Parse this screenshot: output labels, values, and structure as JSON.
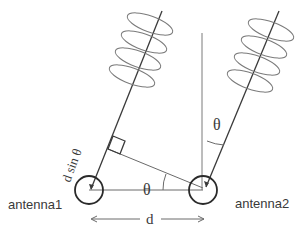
{
  "diagram": {
    "labels": {
      "antenna1": "antenna1",
      "antenna2": "antenna2",
      "spacing": "d",
      "path_difference": "d sin θ",
      "angle_base": "θ",
      "angle_top": "θ"
    },
    "colors": {
      "line": "#3a3a3a",
      "thin_line": "#6a6a6a",
      "coil": "#7a7a7a",
      "text": "#3a3a3a"
    },
    "elements": {
      "antenna1_center": [
        89,
        190
      ],
      "antenna2_center": [
        203,
        190
      ],
      "antenna_radius": 14,
      "wave_coils_per_ray": 4
    }
  }
}
